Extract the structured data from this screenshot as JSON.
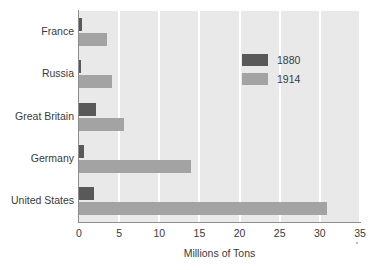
{
  "chart_data": {
    "type": "bar",
    "orientation": "horizontal",
    "title": "",
    "xlabel": "Millions of Tons",
    "ylabel": "",
    "categories": [
      "France",
      "Russia",
      "Great Britain",
      "Germany",
      "United States"
    ],
    "series": [
      {
        "name": "1880",
        "color": "#595959",
        "values": [
          0.4,
          0.3,
          2.1,
          0.6,
          1.9
        ]
      },
      {
        "name": "1914",
        "color": "#a3a3a3",
        "values": [
          3.5,
          4.1,
          5.6,
          14.0,
          30.9
        ]
      }
    ],
    "xlim": [
      0,
      35
    ],
    "xticks": [
      "0",
      "5",
      "10",
      "15",
      "20",
      "25",
      "30",
      "35"
    ],
    "grid": "vertical-white",
    "legend_position": "upper-right",
    "plot_background": "#e9e9e9"
  },
  "legend": {
    "entries": [
      {
        "label": "1880"
      },
      {
        "label": "1914"
      }
    ]
  }
}
